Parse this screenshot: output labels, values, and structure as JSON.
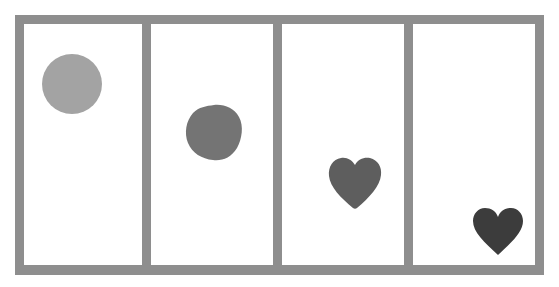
{
  "diagram": {
    "frame_color": "#8e8e8e",
    "panel_background": "#ffffff",
    "panels": [
      {
        "index": 1,
        "shape": "circle",
        "color": "#a3a3a3",
        "position": "upper-left"
      },
      {
        "index": 2,
        "shape": "rounded-blob",
        "color": "#747474",
        "position": "upper-middle"
      },
      {
        "index": 3,
        "shape": "rounded-heart",
        "color": "#5e5e5e",
        "position": "lower-middle"
      },
      {
        "index": 4,
        "shape": "heart",
        "color": "#3c3c3c",
        "position": "bottom-right"
      }
    ]
  }
}
